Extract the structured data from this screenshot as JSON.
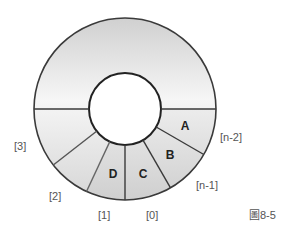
{
  "figure": {
    "caption": "圖8-5",
    "type": "circular-queue-ring"
  },
  "ring": {
    "center": [
      125,
      109
    ],
    "outer_radius": 91,
    "inner_radius": 36,
    "fill_top": "#cfcfcf",
    "fill_bottom": "#f4f4f4",
    "occupied_fill": "#d8d8d8",
    "stroke": "#3a3a3a"
  },
  "cells": [
    {
      "content": "A",
      "index_label": "[n-2]"
    },
    {
      "content": "B",
      "index_label": "[n-1]"
    },
    {
      "content": "C",
      "index_label": "[0]"
    },
    {
      "content": "D",
      "index_label": "[1]"
    },
    {
      "content": "",
      "index_label": "[2]"
    },
    {
      "content": "",
      "index_label": "[3]"
    }
  ]
}
